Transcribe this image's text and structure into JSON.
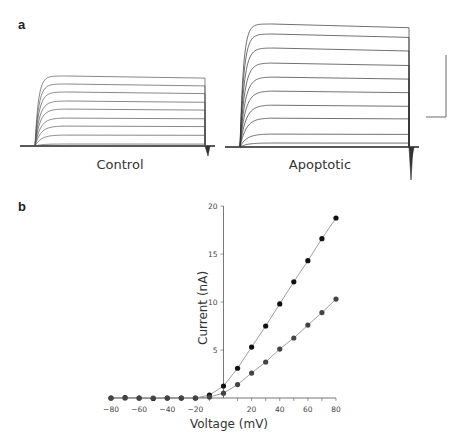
{
  "panels": {
    "a": {
      "label": "a",
      "traces": [
        {
          "name": "Control",
          "label": "Control",
          "steady_levels_px": [
            2,
            11,
            20,
            28,
            37,
            45,
            54,
            62,
            70
          ]
        },
        {
          "name": "Apoptotic",
          "label": "Apoptotic",
          "steady_levels_px": [
            4,
            13,
            29,
            42,
            56,
            70,
            84,
            99,
            113,
            123
          ]
        }
      ],
      "scale_bar": {
        "vertical": true,
        "horizontal": true
      }
    },
    "b": {
      "label": "b"
    }
  },
  "chart_data": [
    {
      "type": "line",
      "title": "",
      "xlabel": "Voltage (mV)",
      "ylabel": "Current (nA)",
      "x": [
        -80,
        -70,
        -60,
        -50,
        -40,
        -30,
        -20,
        -10,
        0,
        10,
        20,
        30,
        40,
        50,
        60,
        70,
        80
      ],
      "series": [
        {
          "name": "Apoptotic",
          "values": [
            0,
            0.05,
            0,
            -0.05,
            0,
            0,
            0,
            0.3,
            1.25,
            3.1,
            5.3,
            7.5,
            9.8,
            12.1,
            14.3,
            16.6,
            18.75
          ],
          "color": "#111111"
        },
        {
          "name": "Control",
          "values": [
            0,
            0,
            0,
            0,
            0,
            0,
            0,
            0.1,
            0.5,
            1.4,
            2.6,
            3.75,
            5.1,
            6.25,
            7.6,
            8.9,
            10.3
          ],
          "color": "#444444"
        }
      ],
      "xticks": [
        "-80",
        "-60",
        "-40",
        "-20",
        "20",
        "40",
        "60",
        "80"
      ],
      "yticks": [
        "5",
        "10",
        "15",
        "20"
      ],
      "xlim": [
        -80,
        80
      ],
      "ylim": [
        0,
        20
      ],
      "grid": false,
      "legend": "none"
    }
  ]
}
